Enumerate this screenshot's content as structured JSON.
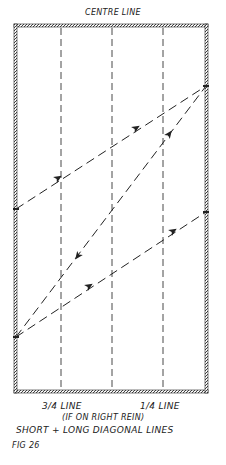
{
  "diagram": {
    "title": "CENTRE LINE",
    "label_three_quarter": "3/4 LINE",
    "label_quarter": "1/4 LINE",
    "note": "(IF ON RIGHT REIN)",
    "caption": "SHORT + LONG DIAGONAL LINES",
    "figure_number": "FIG 26",
    "colors": {
      "ink": "#222222",
      "wall_fill": "#888888"
    },
    "arena": {
      "left": 16,
      "right": 206,
      "top": 26,
      "bottom": 392
    },
    "guide_lines_x": [
      61,
      112,
      163
    ],
    "points": {
      "A_right_upper": [
        206,
        86
      ],
      "B_left_middle": [
        16,
        209
      ],
      "C_left_lower": [
        16,
        337
      ],
      "D_right_middle": [
        206,
        212
      ]
    },
    "paths": [
      {
        "name": "short-diagonal-upper",
        "from": "B_left_middle",
        "to": "A_right_upper"
      },
      {
        "name": "long-diagonal",
        "from": "C_left_lower",
        "to": "A_right_upper"
      },
      {
        "name": "short-diagonal-lower",
        "from": "C_left_lower",
        "to": "D_right_middle"
      }
    ]
  }
}
